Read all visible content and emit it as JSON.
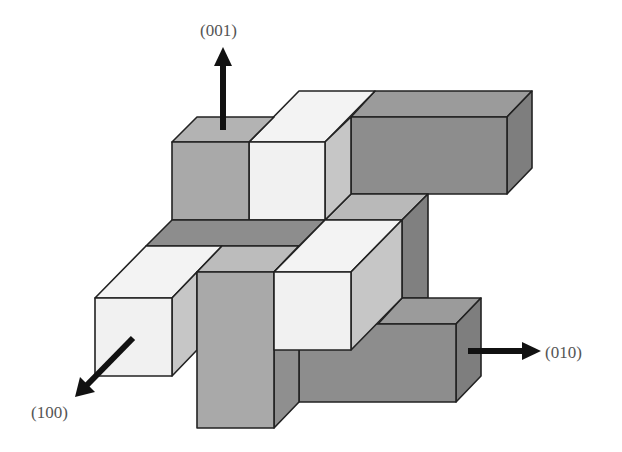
{
  "diagram": {
    "type": "3D block structure with crystallographic direction arrows",
    "labels": {
      "axis_001": "(001)",
      "axis_010": "(010)",
      "axis_100": "(100)"
    },
    "colors": {
      "white_face": "#f1f1f1",
      "light_side": "#c6c6c6",
      "mid_grey": "#a9a9a9",
      "dark_grey": "#8d8d8d",
      "darker_side": "#7e7e7e",
      "arrow": "#111111",
      "edge": "#222222"
    },
    "blocks": [
      {
        "name": "top-dark-bar",
        "shade": "dark_grey"
      },
      {
        "name": "top-grey-cube",
        "shade": "mid_grey"
      },
      {
        "name": "top-white-block",
        "shade": "white_face"
      },
      {
        "name": "middle-dark-band",
        "shade": "dark_grey"
      },
      {
        "name": "left-white-block",
        "shade": "white_face"
      },
      {
        "name": "front-grey-pillar",
        "shade": "mid_grey"
      },
      {
        "name": "middle-white-cube",
        "shade": "white_face"
      },
      {
        "name": "right-vertical-piece",
        "shade": "dark_grey"
      },
      {
        "name": "lower-dark-bar",
        "shade": "dark_grey"
      }
    ]
  }
}
